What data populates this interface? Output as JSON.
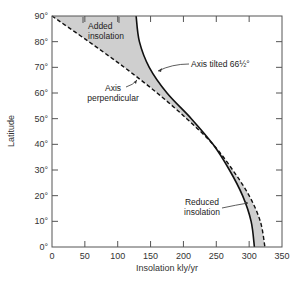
{
  "chart_data": {
    "type": "line",
    "title": "",
    "xlabel": "Insolation kly/yr",
    "ylabel": "Latitude",
    "xlim": [
      0,
      350
    ],
    "ylim": [
      0,
      90
    ],
    "grid": false,
    "x_ticks": [
      0,
      50,
      100,
      150,
      200,
      250,
      300,
      350
    ],
    "x_tick_labels": [
      "0",
      "50",
      "100",
      "150",
      "200",
      "250",
      "300",
      "350"
    ],
    "y_ticks": [
      0,
      10,
      20,
      30,
      40,
      50,
      60,
      70,
      80,
      90
    ],
    "y_tick_labels": [
      "0°",
      "10°",
      "20°",
      "30°",
      "40°",
      "50°",
      "60°",
      "70°",
      "80°",
      "90°"
    ],
    "series": [
      {
        "name": "Axis tilted 66½°",
        "style": "solid",
        "color": "#111111",
        "latitude": [
          90,
          80,
          70,
          60,
          50,
          40,
          30,
          20,
          10,
          0
        ],
        "insolation": [
          128,
          133,
          148,
          175,
          212,
          245,
          270,
          290,
          303,
          308
        ]
      },
      {
        "name": "Axis perpendicular",
        "style": "dashed",
        "color": "#111111",
        "latitude": [
          90,
          80,
          70,
          60,
          50,
          40,
          30,
          20,
          10,
          0
        ],
        "insolation": [
          0,
          56,
          110,
          160,
          205,
          245,
          275,
          300,
          317,
          324
        ]
      }
    ],
    "shaded_regions": [
      {
        "label": "Added insolation",
        "between": "curves",
        "latitude_range": [
          40,
          90
        ],
        "color": "#c8c8c8"
      },
      {
        "label": "Reduced insolation",
        "between": "curves",
        "latitude_range": [
          0,
          40
        ],
        "color": "#c8c8c8"
      }
    ],
    "annotations": [
      {
        "text_lines": [
          "Added",
          "insolation"
        ],
        "x": 52,
        "y": 86
      },
      {
        "text_lines": [
          "Axis tilted 66½°"
        ],
        "x": 230,
        "y": 70
      },
      {
        "text_lines": [
          "Axis",
          "perpendicular"
        ],
        "x": 50,
        "y": 60
      },
      {
        "text_lines": [
          "Reduced",
          "insolation"
        ],
        "x": 240,
        "y": 22
      }
    ],
    "legend": "none (inline annotations)"
  },
  "layout": {
    "plot_left": 52,
    "plot_right": 282,
    "plot_top": 16,
    "plot_bottom": 247,
    "shade_color": "#cfcfcf",
    "line_color": "#111111",
    "axis_color": "#555555"
  }
}
